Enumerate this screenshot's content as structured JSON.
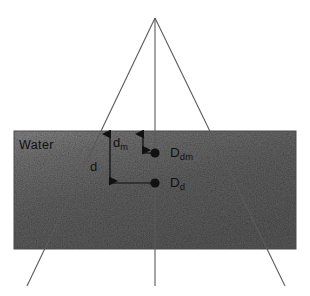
{
  "figure": {
    "background_color": "#ffffff",
    "water_label": "Water",
    "labels": {
      "dm_main": "d",
      "dm_sub": "m",
      "d_main": "d",
      "Ddm_main": "D",
      "Ddm_sub": "dm",
      "Dd_main": "D",
      "Dd_sub": "d"
    },
    "colors": {
      "water_fill_dark": "#565656",
      "water_fill_light": "#787878",
      "line": "#5a5a5a",
      "marker": "#111111",
      "text": "#111111"
    },
    "geometry": {
      "water_rect": {
        "x": 14,
        "y": 131,
        "width": 282,
        "height": 118
      },
      "apex": {
        "x": 155,
        "y": 18
      },
      "left_ray_end": {
        "x": 27,
        "y": 286
      },
      "right_ray_end": {
        "x": 285,
        "y": 286
      },
      "center_line": {
        "x": 155,
        "y_top": 18,
        "y_bottom": 286
      },
      "marker_dm": {
        "x": 155,
        "y": 153
      },
      "marker_d": {
        "x": 155,
        "y": 183
      }
    }
  }
}
